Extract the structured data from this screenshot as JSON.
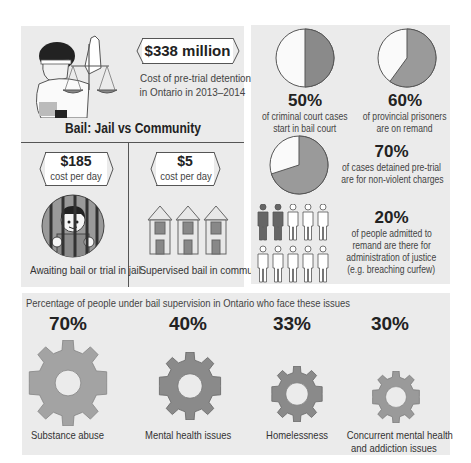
{
  "headline": {
    "amount": "$338 million",
    "description_line1": "Cost of pre-trial detention",
    "description_line2": "in Ontario in 2013–2014",
    "icon": "lady-justice-icon"
  },
  "comparison": {
    "title": "Bail: Jail vs Community",
    "jail": {
      "amount": "$185",
      "unit": "cost per day",
      "caption": "Awaiting bail or trial in jail",
      "icon": "jailed-person-icon"
    },
    "community": {
      "amount": "$5",
      "unit": "cost per day",
      "caption": "Supervised bail in community",
      "icon": "houses-icon"
    }
  },
  "stats": [
    {
      "percent": "50%",
      "line1": "of criminal court cases",
      "line2": "start in bail court",
      "value": 50
    },
    {
      "percent": "60%",
      "line1": "of provincial prisoners",
      "line2": "are on remand",
      "value": 60
    },
    {
      "percent": "70%",
      "line1": "of cases detained pre-trial",
      "line2": "are for non-violent charges",
      "value": 70
    },
    {
      "percent": "20%",
      "line1": "of people admitted to",
      "line2": "remand are there for",
      "line3": "administration of justice",
      "line4": "(e.g. breaching curfew)",
      "value": 20
    }
  ],
  "issues": {
    "title": "Percentage of people under bail supervision in Ontario who face these issues",
    "items": [
      {
        "percent": "70%",
        "label": "Substance abuse",
        "value": 70
      },
      {
        "percent": "40%",
        "label": "Mental health issues",
        "value": 40
      },
      {
        "percent": "33%",
        "label": "Homelessness",
        "value": 33
      },
      {
        "percent": "30%",
        "label_line1": "Concurrent mental health",
        "label_line2": "and addiction issues",
        "value": 30
      }
    ]
  },
  "colors": {
    "panel_bg": "#ebebeb",
    "pie_fill": "#9a9a9a",
    "pie_fill_dark": "#7f7f7f",
    "gear_light": "#a3a3a3",
    "gear_dark": "#8a8a8a",
    "figure_dark": "#666666"
  }
}
